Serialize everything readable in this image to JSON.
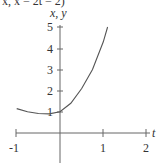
{
  "header_fragment": "x, x = 2t = 2)",
  "chart_data": {
    "type": "line",
    "title": "",
    "xlabel": "t",
    "ylabel": "x, y",
    "xlim": [
      -1,
      2
    ],
    "ylim": [
      0,
      5
    ],
    "x_ticks": [
      "-1",
      "1",
      "2"
    ],
    "y_ticks": [
      "1",
      "2",
      "3",
      "4",
      "5"
    ],
    "grid": false,
    "series": [
      {
        "name": "curve",
        "x": [
          -1.0,
          -0.75,
          -0.5,
          -0.25,
          0.0,
          0.25,
          0.5,
          0.75,
          1.0,
          1.1
        ],
        "y": [
          1.15,
          1.0,
          0.92,
          0.9,
          1.0,
          1.4,
          2.1,
          3.0,
          4.3,
          5.0
        ]
      }
    ],
    "line_color": "#555555"
  }
}
